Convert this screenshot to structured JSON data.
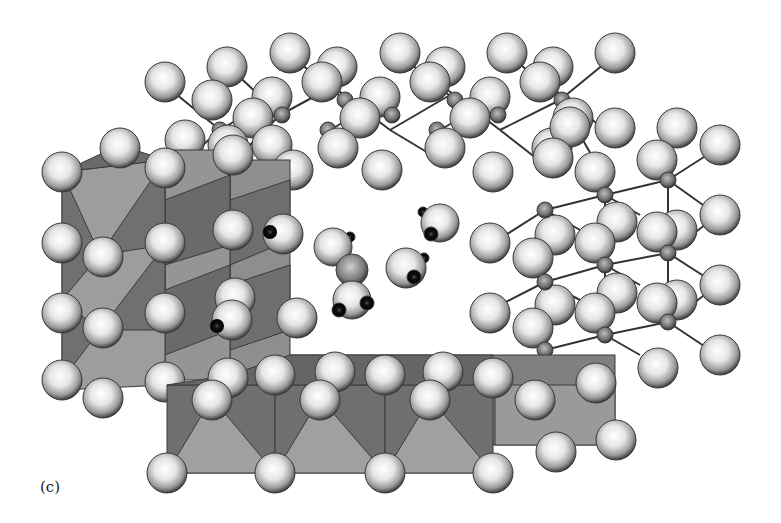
{
  "figure": {
    "panel_label": "(c)",
    "colors": {
      "background": "#ffffff",
      "polyhedron_light": "#9a9a9a",
      "polyhedron_dark": "#6e6e6e",
      "polyhedron_edge": "#3a3a3a",
      "atom_large_light": "#ffffff",
      "atom_large_dark": "#4a4a4a",
      "atom_small": "#6a6a6a",
      "hydrogen": "#111111",
      "bond": "#333333"
    }
  }
}
